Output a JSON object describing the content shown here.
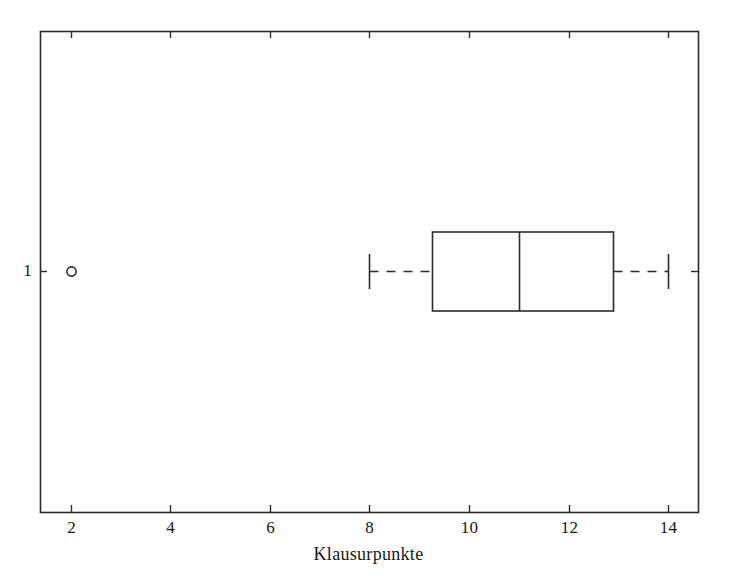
{
  "figure": {
    "width": 730,
    "height": 572,
    "background_color": "#ffffff",
    "line_color": "#2b2b2b",
    "plot_area": {
      "left": 40,
      "top": 31,
      "right": 698,
      "bottom": 512
    }
  },
  "chart_data": {
    "type": "boxplot",
    "title": "",
    "orientation": "horizontal",
    "xlabel": "Klausurpunkte",
    "ylabel": "",
    "xlim": [
      1.38,
      14.6
    ],
    "xticks": [
      2,
      4,
      6,
      8,
      10,
      12,
      14
    ],
    "xtick_labels": [
      "2",
      "4",
      "6",
      "8",
      "10",
      "12",
      "14"
    ],
    "yticks": [
      1
    ],
    "ytick_labels": [
      "1"
    ],
    "grid": false,
    "legend": null,
    "box_color": "#2b2b2b",
    "median_color": "#2b2b2b",
    "whisker_style": "dashed",
    "outlier_marker": "open-circle",
    "boxes": [
      {
        "group": "1",
        "y_position": 1,
        "whisker_low": 8.0,
        "q1": 9.25,
        "median": 11.0,
        "q3": 12.9,
        "whisker_high": 14.0,
        "outliers": [
          2.0
        ]
      }
    ]
  }
}
